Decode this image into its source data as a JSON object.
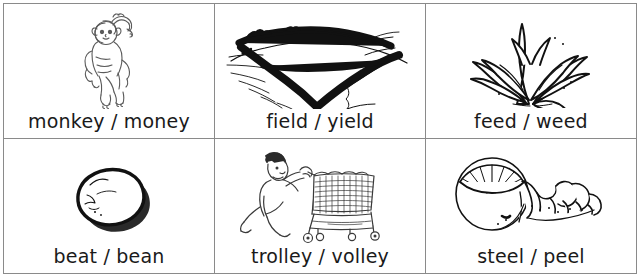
{
  "worksheet": {
    "title": "Minimal pairs picture grid",
    "columns": 3,
    "rows": 2,
    "border_color": "#8a8a8a",
    "text_color": "#1a1a1a",
    "background_color": "#ffffff",
    "cells": [
      {
        "label": "monkey / money",
        "word_a": "monkey",
        "separator": "/",
        "word_b": "money",
        "illustration": "monkey-line-drawing"
      },
      {
        "label": "field / yield",
        "word_a": "field",
        "separator": "/",
        "word_b": "yield",
        "illustration": "field-landscape-hedgerow-drawing"
      },
      {
        "label": "feed / weed",
        "word_a": "feed",
        "separator": "/",
        "word_b": "weed",
        "illustration": "weed-plant-drawing"
      },
      {
        "label": "beat / bean",
        "word_a": "beat",
        "separator": "/",
        "word_b": "bean",
        "illustration": "bean-drawing"
      },
      {
        "label": "trolley / volley",
        "word_a": "trolley",
        "separator": "/",
        "word_b": "volley",
        "illustration": "man-pushing-shopping-trolley-drawing"
      },
      {
        "label": "steel / peel",
        "word_a": "steel",
        "separator": "/",
        "word_b": "peel",
        "illustration": "orange-with-spiral-peel-drawing"
      }
    ]
  }
}
